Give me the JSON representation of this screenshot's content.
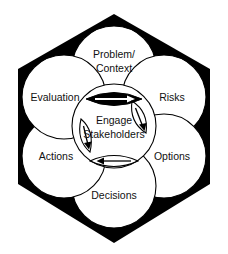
{
  "diagram": {
    "shape": "hexagon",
    "colors": {
      "background": "#ffffff",
      "hexagon_fill": "#000000",
      "circle_fill": "#ffffff",
      "circle_stroke": "#000000",
      "text": "#111111",
      "lens_filled": "#000000",
      "arrow_light": "#ffffff",
      "arrow_dark": "#000000"
    },
    "center": {
      "name": "engage-stakeholders",
      "line1": "Engage",
      "line2": "Stakeholders"
    },
    "nodes": [
      {
        "name": "problem-context",
        "position": "top",
        "line1": "Problem/",
        "line2": "Context"
      },
      {
        "name": "risks",
        "position": "right-upper",
        "line1": "Risks",
        "line2": ""
      },
      {
        "name": "options",
        "position": "right-lower",
        "line1": "Options",
        "line2": ""
      },
      {
        "name": "decisions",
        "position": "bottom",
        "line1": "Decisions",
        "line2": ""
      },
      {
        "name": "actions",
        "position": "left-lower",
        "line1": "Actions",
        "line2": ""
      },
      {
        "name": "evaluation",
        "position": "left-upper",
        "line1": "Evaluation",
        "line2": ""
      }
    ],
    "connectors": [
      {
        "name": "lens-top",
        "style": "filled",
        "arrow_direction": "right",
        "arrow_color": "white"
      },
      {
        "name": "lens-upper-right",
        "style": "outline",
        "arrow_direction": "down-left",
        "arrow_color": "black"
      },
      {
        "name": "lens-lower-left",
        "style": "outline",
        "arrow_direction": "down",
        "arrow_color": "black"
      },
      {
        "name": "lens-bottom",
        "style": "outline",
        "arrow_direction": "left",
        "arrow_color": "black"
      }
    ]
  }
}
